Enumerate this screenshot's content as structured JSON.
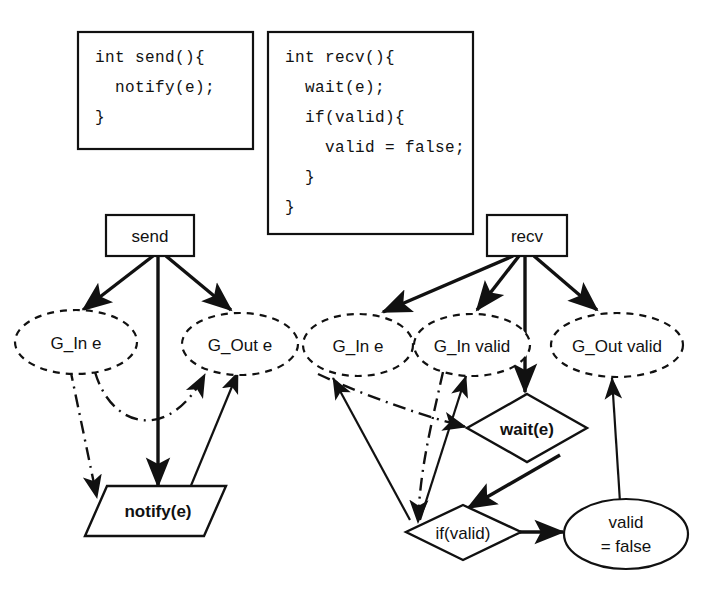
{
  "figure": {
    "type": "program-dependence-graph-diagram",
    "background_color": "#ffffff",
    "ink_color": "#111111"
  },
  "code_boxes": [
    {
      "id": "send-code",
      "name": "send-code-box",
      "lines": [
        "int send(){",
        "  notify(e);",
        "}"
      ],
      "text": "int send(){\n  notify(e);\n}"
    },
    {
      "id": "recv-code",
      "name": "recv-code-box",
      "lines": [
        "int recv(){",
        "  wait(e);",
        "  if(valid){",
        "    valid = false;",
        "  }",
        "}"
      ],
      "text": "int recv(){\n  wait(e);\n  if(valid){\n    valid = false;\n  }\n}"
    }
  ],
  "nodes": {
    "send": {
      "label": "send",
      "shape": "rectangle",
      "style": "solid"
    },
    "recv": {
      "label": "recv",
      "shape": "rectangle",
      "style": "solid"
    },
    "g_in_e_left": {
      "label": "G_In e",
      "shape": "ellipse",
      "style": "dashed"
    },
    "g_out_e": {
      "label": "G_Out e",
      "shape": "ellipse",
      "style": "dashed"
    },
    "g_in_e_right": {
      "label": "G_In e",
      "shape": "ellipse",
      "style": "dashed"
    },
    "g_in_valid": {
      "label": "G_In valid",
      "shape": "ellipse",
      "style": "dashed"
    },
    "g_out_valid": {
      "label": "G_Out valid",
      "shape": "ellipse",
      "style": "dashed"
    },
    "notify": {
      "label": "notify(e)",
      "shape": "parallelogram",
      "style": "solid-bold"
    },
    "wait": {
      "label": "wait(e)",
      "shape": "diamond",
      "style": "solid-bold"
    },
    "if_valid": {
      "label": "if(valid)",
      "shape": "diamond",
      "style": "solid"
    },
    "valid_false": {
      "label_line1": "valid",
      "label_line2": "= false",
      "shape": "ellipse",
      "style": "solid"
    }
  },
  "edges": [
    {
      "from": "send",
      "to": "g_in_e_left",
      "style": "solid",
      "arrow": true
    },
    {
      "from": "send",
      "to": "notify",
      "style": "solid",
      "arrow": true
    },
    {
      "from": "send",
      "to": "g_out_e",
      "style": "solid",
      "arrow": true
    },
    {
      "from": "g_in_e_left",
      "to": "notify",
      "style": "dash-dot",
      "arrow": true
    },
    {
      "from": "g_in_e_left",
      "to": "g_out_e",
      "style": "dash-dot",
      "arrow": true
    },
    {
      "from": "notify",
      "to": "g_out_e",
      "style": "solid",
      "arrow": true
    },
    {
      "from": "recv",
      "to": "g_in_e_right",
      "style": "solid",
      "arrow": true
    },
    {
      "from": "recv",
      "to": "g_in_valid",
      "style": "solid",
      "arrow": true
    },
    {
      "from": "recv",
      "to": "wait",
      "style": "solid",
      "arrow": true
    },
    {
      "from": "recv",
      "to": "g_out_valid",
      "style": "solid",
      "arrow": true
    },
    {
      "from": "g_in_e_right",
      "to": "wait",
      "style": "dash-dot",
      "arrow": true
    },
    {
      "from": "g_in_valid",
      "to": "if_valid",
      "style": "dash-dot",
      "arrow": true
    },
    {
      "from": "if_valid",
      "to": "g_in_e_right",
      "style": "solid",
      "arrow": true
    },
    {
      "from": "if_valid",
      "to": "g_in_valid",
      "style": "solid",
      "arrow": true
    },
    {
      "from": "wait",
      "to": "if_valid",
      "style": "solid",
      "arrow": true
    },
    {
      "from": "if_valid",
      "to": "valid_false",
      "style": "solid",
      "arrow": true
    },
    {
      "from": "valid_false",
      "to": "g_out_valid",
      "style": "solid",
      "arrow": true
    }
  ]
}
